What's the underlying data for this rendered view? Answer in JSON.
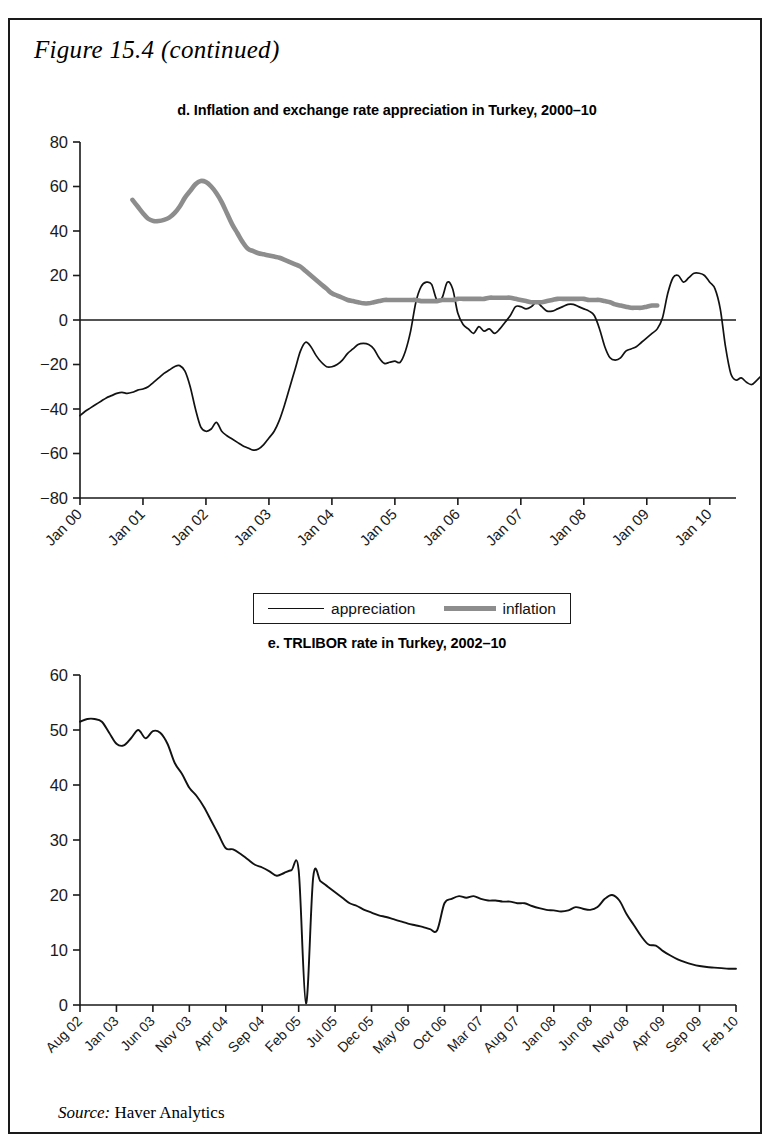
{
  "figure": {
    "label_main": "Figure 15.4",
    "label_cont": "(continued)"
  },
  "source": {
    "prefix": "Source:",
    "text": "Haver Analytics"
  },
  "legend": {
    "items": [
      {
        "label": "appreciation",
        "style": "thin-black",
        "color": "#121212"
      },
      {
        "label": "inflation",
        "style": "thick-gray",
        "color": "#8d8d8d"
      }
    ]
  },
  "chart_data": [
    {
      "id": "panel-d",
      "type": "line",
      "title": "d. Inflation and exchange rate appreciation in Turkey, 2000–10",
      "xlabel": "",
      "ylabel": "",
      "ylim": [
        -80,
        80
      ],
      "yticks": [
        80,
        60,
        40,
        20,
        0,
        -20,
        -40,
        -60,
        -80
      ],
      "ytick_labels": [
        "80",
        "60",
        "40",
        "20",
        "0",
        "−20",
        "−40",
        "−60",
        "−80"
      ],
      "grid": false,
      "zero_line": true,
      "legend_position": "below",
      "xlim": [
        "Jan 00",
        "Jan 10"
      ],
      "xtick_labels": [
        "Jan 00",
        "Jan 01",
        "Jan 02",
        "Jan 03",
        "Jan 04",
        "Jan 05",
        "Jan 06",
        "Jan 07",
        "Jan 08",
        "Jan 09",
        "Jan 10"
      ],
      "x_months": 126,
      "series": [
        {
          "name": "appreciation",
          "color": "#121212",
          "start": "Jan 00",
          "values": [
            -43,
            -41,
            -39.5,
            -38,
            -36.5,
            -35,
            -34,
            -33,
            -32.5,
            -33,
            -32.5,
            -31.5,
            -31,
            -30,
            -28,
            -26,
            -24,
            -22.5,
            -21,
            -20.5,
            -23,
            -30,
            -40,
            -48,
            -50,
            -49,
            -46,
            -50,
            -52,
            -53.5,
            -55,
            -56.5,
            -57.5,
            -58.5,
            -58,
            -56,
            -53,
            -50,
            -45,
            -38,
            -30,
            -22,
            -14,
            -10,
            -12,
            -16,
            -19,
            -21,
            -21,
            -20,
            -18,
            -15,
            -13,
            -11,
            -10.5,
            -11,
            -13,
            -17,
            -19.5,
            -19,
            -18.5,
            -19,
            -14,
            -5,
            8,
            15,
            17,
            16,
            9,
            10,
            17,
            14,
            3,
            -2,
            -4,
            -6,
            -3,
            -5,
            -4,
            -6,
            -4,
            -1,
            2,
            6,
            6,
            5,
            6,
            8,
            6,
            4,
            4,
            5,
            6,
            7,
            7,
            6,
            5,
            4,
            2,
            -4,
            -12,
            -17,
            -18,
            -17,
            -14,
            -13,
            -12,
            -10,
            -8,
            -6,
            -4,
            1,
            12,
            19,
            20,
            17,
            19,
            21,
            21,
            20,
            17,
            14,
            5,
            -12,
            -24,
            -27,
            -26,
            -28,
            -29,
            -27,
            -25,
            -26,
            -24,
            -20,
            -10,
            1,
            6,
            4,
            8,
            7,
            5,
            6,
            7
          ]
        },
        {
          "name": "inflation",
          "color": "#8d8d8d",
          "start": "Nov 00",
          "values": [
            54,
            51,
            48,
            45.5,
            44.5,
            44.5,
            45,
            46,
            48,
            51,
            55,
            58,
            61,
            62.5,
            62,
            60,
            57,
            53,
            48,
            43,
            39,
            35,
            32,
            31,
            30,
            29.5,
            29,
            28.5,
            28,
            27,
            26,
            25,
            24,
            22,
            20,
            18,
            16,
            14,
            12,
            11,
            10,
            9,
            8.5,
            8,
            7.5,
            7.5,
            8,
            8.5,
            9,
            9,
            9,
            9,
            9,
            9,
            9,
            8.5,
            8.5,
            8.5,
            8.5,
            9,
            9,
            9,
            9.5,
            9.5,
            9.5,
            9.5,
            9.5,
            9.5,
            10,
            10,
            10,
            10,
            10,
            9.5,
            9,
            8.5,
            8,
            8,
            8,
            8.5,
            9,
            9.5,
            9.5,
            9.5,
            9.5,
            9.5,
            9.5,
            9,
            9,
            9,
            8.5,
            8,
            7,
            6.5,
            6,
            5.5,
            5.5,
            5.5,
            6,
            6.5,
            6.5
          ]
        }
      ]
    },
    {
      "id": "panel-e",
      "type": "line",
      "title": "e. TRLIBOR rate in Turkey, 2002–10",
      "xlabel": "",
      "ylabel": "",
      "ylim": [
        0,
        60
      ],
      "yticks": [
        60,
        50,
        40,
        30,
        20,
        10,
        0
      ],
      "ytick_labels": [
        "60",
        "50",
        "40",
        "30",
        "20",
        "10",
        "0"
      ],
      "grid": false,
      "zero_line": false,
      "xlim": [
        "Aug 02",
        "Feb 10"
      ],
      "xtick_labels": [
        "Aug 02",
        "Jan 03",
        "Jun 03",
        "Nov 03",
        "Apr 04",
        "Sep 04",
        "Feb 05",
        "Jul 05",
        "Dec 05",
        "May 06",
        "Oct 06",
        "Mar 07",
        "Aug 07",
        "Jan 08",
        "Jun 08",
        "Nov 08",
        "Apr 09",
        "Sep 09",
        "Feb 10"
      ],
      "x_months": 91,
      "series": [
        {
          "name": "TRLIBOR",
          "color": "#121212",
          "start": "Aug 02",
          "values": [
            51.5,
            52,
            52,
            51.5,
            49.5,
            47.5,
            47.2,
            48.5,
            50,
            48.5,
            49.8,
            49.5,
            47.5,
            44,
            42,
            39.5,
            38,
            36,
            33.5,
            31,
            28.5,
            28.3,
            27.5,
            26.5,
            25.5,
            25,
            24.3,
            23.5,
            24,
            24.5,
            24.5,
            0.3,
            23.3,
            22.5,
            21.5,
            20.5,
            19.5,
            18.5,
            18,
            17.3,
            16.8,
            16.3,
            16,
            15.6,
            15.2,
            14.8,
            14.5,
            14.2,
            13.8,
            13.6,
            18.5,
            19.3,
            19.8,
            19.5,
            19.8,
            19.3,
            19,
            19,
            18.8,
            18.8,
            18.5,
            18.5,
            18,
            17.6,
            17.3,
            17.2,
            17,
            17.2,
            17.8,
            17.5,
            17.3,
            17.8,
            19.3,
            20,
            19,
            16.5,
            14.5,
            12.5,
            11,
            10.8,
            9.8,
            9,
            8.3,
            7.8,
            7.4,
            7.1,
            6.9,
            6.8,
            6.7,
            6.6,
            6.6
          ]
        }
      ]
    }
  ]
}
